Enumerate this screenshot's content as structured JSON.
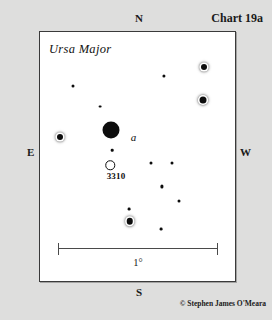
{
  "chart": {
    "title": "Chart 19a",
    "constellation": "Ursa Major",
    "copyright": "© Stephen James O'Meara",
    "cardinals": {
      "north": "N",
      "south": "S",
      "east": "E",
      "west": "W"
    },
    "scale": {
      "label": "1°"
    },
    "colors": {
      "page_background": "#dededd",
      "field_background": "#ffffff",
      "frame_border": "#3a3a3a",
      "star_fill": "#0d0d0d",
      "text": "#1a1a1a"
    }
  },
  "chart_data": {
    "type": "scatter",
    "title": "Chart 19a",
    "subtitle": "Ursa Major",
    "xlabel": "",
    "ylabel": "",
    "xlim": [
      0,
      100
    ],
    "ylim": [
      0,
      100
    ],
    "grid": false,
    "legend": null,
    "axis_directions": {
      "top": "N",
      "bottom": "S",
      "left": "E",
      "right": "W"
    },
    "scale_bar": {
      "length_label": "1°",
      "spans_x": [
        9,
        90
      ]
    },
    "annotations": [
      {
        "text": "Ursa Major",
        "x": 5,
        "y": 94,
        "style": "italic"
      },
      {
        "text": "a",
        "x": 48,
        "y": 58,
        "style": "italic"
      },
      {
        "text": "3310",
        "x": 39,
        "y": 42,
        "style": "bold"
      }
    ],
    "points": [
      {
        "id": "s1",
        "x": 36.5,
        "y": 60.5,
        "size": 17.0,
        "marker": "filled",
        "label": "a",
        "halo": false
      },
      {
        "id": "s2",
        "x": 36.0,
        "y": 46.5,
        "size": 9.5,
        "marker": "open",
        "label": "3310",
        "halo": false
      },
      {
        "id": "s3",
        "x": 37.0,
        "y": 52.5,
        "size": 2.6,
        "marker": "filled",
        "label": null,
        "halo": false
      },
      {
        "id": "s4",
        "x": 10.0,
        "y": 58.0,
        "size": 6.0,
        "marker": "filled",
        "label": null,
        "halo": true
      },
      {
        "id": "s5",
        "x": 84.0,
        "y": 86.0,
        "size": 6.0,
        "marker": "filled",
        "label": null,
        "halo": true
      },
      {
        "id": "s6",
        "x": 83.5,
        "y": 72.5,
        "size": 7.0,
        "marker": "filled",
        "label": null,
        "halo": true
      },
      {
        "id": "s7",
        "x": 46.0,
        "y": 24.0,
        "size": 6.5,
        "marker": "filled",
        "label": null,
        "halo": true
      },
      {
        "id": "s8",
        "x": 63.5,
        "y": 82.5,
        "size": 3.2,
        "marker": "filled",
        "label": null,
        "halo": false
      },
      {
        "id": "s9",
        "x": 17.0,
        "y": 78.5,
        "size": 3.0,
        "marker": "filled",
        "label": null,
        "halo": false
      },
      {
        "id": "s10",
        "x": 31.0,
        "y": 70.0,
        "size": 2.8,
        "marker": "filled",
        "label": null,
        "halo": false
      },
      {
        "id": "s11",
        "x": 57.0,
        "y": 47.5,
        "size": 3.0,
        "marker": "filled",
        "label": null,
        "halo": false
      },
      {
        "id": "s12",
        "x": 67.5,
        "y": 47.5,
        "size": 3.0,
        "marker": "filled",
        "label": null,
        "halo": false
      },
      {
        "id": "s13",
        "x": 62.5,
        "y": 38.0,
        "size": 3.2,
        "marker": "filled",
        "label": null,
        "halo": false
      },
      {
        "id": "s14",
        "x": 71.5,
        "y": 32.0,
        "size": 3.0,
        "marker": "filled",
        "label": null,
        "halo": false
      },
      {
        "id": "s15",
        "x": 45.5,
        "y": 29.0,
        "size": 2.8,
        "marker": "filled",
        "label": null,
        "halo": false
      },
      {
        "id": "s16",
        "x": 62.0,
        "y": 21.0,
        "size": 2.8,
        "marker": "filled",
        "label": null,
        "halo": false
      }
    ]
  }
}
